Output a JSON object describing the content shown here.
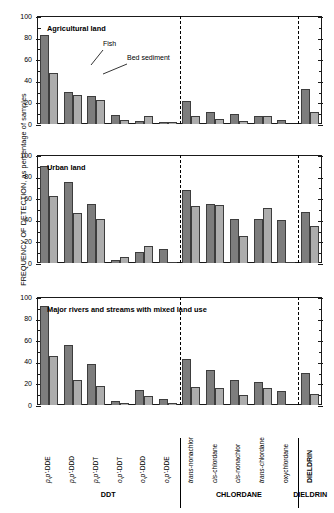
{
  "axis": {
    "y_title": "FREQUENCY OF DETECTION, as percentage of samples",
    "y_ticks": [
      "0",
      "20",
      "40",
      "60",
      "80",
      "100"
    ],
    "y_min": 0,
    "y_max": 100
  },
  "legend": {
    "fish_label": "Fish",
    "sediment_label": "Bed sediment",
    "fish_color": "#7d7d7d",
    "sediment_color": "#adadad"
  },
  "groups": [
    {
      "name": "DDT",
      "count": 6
    },
    {
      "name": "CHLORDANE",
      "count": 5
    },
    {
      "name": "DIELDRIN",
      "count": 1
    }
  ],
  "categories": [
    {
      "prefix": "p,p'",
      "suffix": "-DDE",
      "italic": true
    },
    {
      "prefix": "p,p'",
      "suffix": "-DDD",
      "italic": true
    },
    {
      "prefix": "p,p'",
      "suffix": "-DDT",
      "italic": true
    },
    {
      "prefix": "o,p'",
      "suffix": "-DDT",
      "italic": true
    },
    {
      "prefix": "o,p'",
      "suffix": "-DDD",
      "italic": true
    },
    {
      "prefix": "o,p'",
      "suffix": "-DDE",
      "italic": true
    },
    {
      "prefix": "trans",
      "suffix": "-nonachlor",
      "italic": true
    },
    {
      "prefix": "cis",
      "suffix": "-chlordane",
      "italic": true
    },
    {
      "prefix": "cis",
      "suffix": "-nonachlor",
      "italic": true
    },
    {
      "prefix": "trans",
      "suffix": "-chlordane",
      "italic": true
    },
    {
      "prefix": "",
      "suffix": "oxychlordane",
      "italic": false
    },
    {
      "prefix": "",
      "suffix": "DIELDRIN",
      "italic": false,
      "bold": true
    }
  ],
  "chart_data": {
    "type": "bar",
    "xlabel": "",
    "ylabel": "FREQUENCY OF DETECTION, as percentage of samples",
    "ylim": [
      0,
      100
    ],
    "yticks": [
      0,
      20,
      40,
      60,
      80,
      100
    ],
    "grid": false,
    "legend_position": "annotated-inline",
    "categories": [
      "p,p'-DDE",
      "p,p'-DDD",
      "p,p'-DDT",
      "o,p'-DDT",
      "o,p'-DDD",
      "o,p'-DDE",
      "trans-nonachlor",
      "cis-chlordane",
      "cis-nonachlor",
      "trans-chlordane",
      "oxychlordane",
      "DIELDRIN"
    ],
    "panels": [
      {
        "title": "Agricultural land",
        "series": [
          {
            "name": "Fish",
            "values": [
              82,
              30,
              26,
              8,
              3,
              2,
              21,
              11,
              9,
              7,
              4,
              32
            ]
          },
          {
            "name": "Bed sediment",
            "values": [
              47,
              27,
              22,
              4,
              7,
              2,
              7,
              5,
              3,
              7,
              0,
              11
            ]
          }
        ]
      },
      {
        "title": "Urban land",
        "series": [
          {
            "name": "Fish",
            "values": [
              90,
              75,
              55,
              3,
              10,
              13,
              68,
              55,
              41,
              41,
              40,
              47
            ]
          },
          {
            "name": "Bed sediment",
            "values": [
              62,
              46,
              41,
              6,
              16,
              1,
              53,
              54,
              25,
              51,
              1,
              34
            ]
          }
        ]
      },
      {
        "title": "Major rivers and streams with mixed land use",
        "series": [
          {
            "name": "Fish",
            "values": [
              92,
              56,
              38,
              4,
              14,
              6,
              43,
              32,
              23,
              21,
              13,
              30
            ]
          },
          {
            "name": "Bed sediment",
            "values": [
              45,
              23,
              18,
              2,
              8,
              2,
              17,
              16,
              9,
              16,
              0,
              10
            ]
          }
        ]
      }
    ]
  }
}
